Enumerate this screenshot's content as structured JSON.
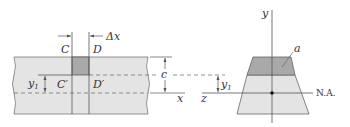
{
  "diagram": {
    "beam_side_view": {
      "labels": {
        "section_C": "C",
        "section_D": "D",
        "delta_x": "Δx",
        "point_C_prime": "C′",
        "point_D_prime": "D′",
        "y1": "y",
        "y1_sub": "1",
        "c": "c",
        "x_axis": "x"
      }
    },
    "cross_section": {
      "labels": {
        "y_axis": "y",
        "z_axis": "z",
        "area": "a",
        "y1": "y",
        "y1_sub": "1",
        "neutral_axis": "N.A."
      }
    },
    "colors": {
      "beam_fill": "#e4e4e4",
      "shaded_area": "#a9a9a9",
      "line": "#555555"
    }
  }
}
